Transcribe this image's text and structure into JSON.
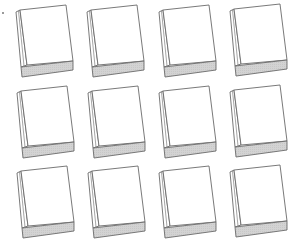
{
  "scene": {
    "description": "Grid of 12 blank book icons (3 rows x 4 columns)",
    "rows": 3,
    "columns": 4,
    "background": "#ffffff"
  },
  "style": {
    "outline_color": "#6a6a6a",
    "cover_fill": "#ffffff",
    "band_fill": "#d3d3d3",
    "spine_fill": "#ffffff"
  },
  "books": [
    {
      "row": 1,
      "col": 1,
      "label": "Blank book"
    },
    {
      "row": 1,
      "col": 2,
      "label": "Blank book"
    },
    {
      "row": 1,
      "col": 3,
      "label": "Blank book"
    },
    {
      "row": 1,
      "col": 4,
      "label": "Blank book"
    },
    {
      "row": 2,
      "col": 1,
      "label": "Blank book"
    },
    {
      "row": 2,
      "col": 2,
      "label": "Blank book"
    },
    {
      "row": 2,
      "col": 3,
      "label": "Blank book"
    },
    {
      "row": 2,
      "col": 4,
      "label": "Blank book"
    },
    {
      "row": 3,
      "col": 1,
      "label": "Blank book"
    },
    {
      "row": 3,
      "col": 2,
      "label": "Blank book"
    },
    {
      "row": 3,
      "col": 3,
      "label": "Blank book"
    },
    {
      "row": 3,
      "col": 4,
      "label": "Blank book"
    }
  ]
}
